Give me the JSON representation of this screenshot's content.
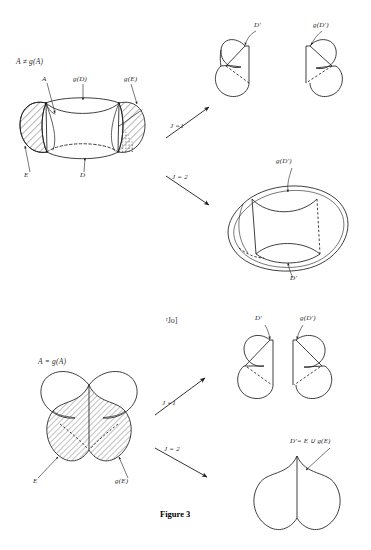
{
  "figure": {
    "caption": "Figure 3",
    "artifact_text": "ʳJo]",
    "ink_color": "#1d1d1d",
    "hatch_color": "#2a2a2a",
    "background": "#ffffff"
  },
  "panels": {
    "top_left": {
      "condition_label": "A ≠ g(A)",
      "labels": {
        "a": "A",
        "gd": "g(D)",
        "ge": "g(E)",
        "e": "E",
        "d": "D"
      }
    },
    "bottom_left": {
      "condition_label": "A = g(A)",
      "labels": {
        "e": "E",
        "ge": "g(E)"
      }
    },
    "top_right_j1": {
      "labels": {
        "dprime": "D'",
        "gdprime": "g(D')"
      }
    },
    "top_right_j2": {
      "labels": {
        "gdprime": "g(D')",
        "dprime": "D'"
      }
    },
    "bottom_right_j1": {
      "labels": {
        "dprime": "D'",
        "gdprime": "g(D')"
      }
    },
    "bottom_right_j2": {
      "labels": {
        "union": "D'= E ∪ g(E)"
      }
    }
  },
  "arrows": {
    "top_j1": "J =1",
    "top_j2": "J = 2",
    "bottom_j1": "J =1",
    "bottom_j2": "J = 2"
  }
}
